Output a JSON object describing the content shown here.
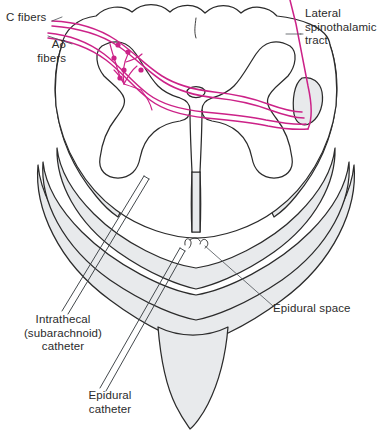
{
  "figure": {
    "background_color": "#ffffff",
    "ink_color": "#2b2b2b",
    "fiber_color": "#cc2288",
    "shade_color": "#e8eaec"
  },
  "labels": {
    "c_fibers": "C fibers",
    "ad_fibers": "Aδ\nfibers",
    "lateral_spinothalamic_tract": "Lateral\nspinothalamic\ntract",
    "epidural_space": "Epidural space",
    "intrathecal_catheter": "Intrathecal\n(subarachnoid)\ncatheter",
    "epidural_catheter": "Epidural\ncatheter"
  },
  "structures": {
    "gray_matter": "butterfly-shaped gray matter",
    "dorsal_horn": "dorsal horn",
    "ventral_horn": "ventral horn",
    "central_canal": "central canal",
    "dura_mater": "dura mater",
    "spinous_process": "spinous process",
    "lamina": "vertebral lamina"
  },
  "annotations": {
    "synapse_count": 6,
    "fiber_tracts": [
      "C fibers",
      "Aδ fibers",
      "Lateral spinothalamic tract"
    ],
    "catheters": [
      "Intrathecal (subarachnoid) catheter",
      "Epidural catheter"
    ]
  }
}
